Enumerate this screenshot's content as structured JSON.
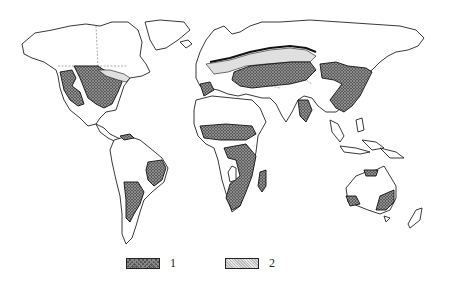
{
  "map": {
    "type": "world distribution map",
    "style": "black-and-white, hatched regions",
    "zones": [
      {
        "id": "1",
        "pattern": "dark cross-hatch",
        "regions": [
          "central/western North America",
          "Iberia",
          "Sahel belt of Africa",
          "southern/eastern Africa",
          "Madagascar",
          "eastern Brazil",
          "Argentina",
          "southern Russia/Kazakhstan steppe",
          "Mongolia/north-east China",
          "eastern China",
          "India",
          "northern Australia",
          "south-western Australia",
          "south-eastern Australia"
        ]
      },
      {
        "id": "2",
        "pattern": "light stipple",
        "regions": [
          "Great Lakes / south-eastern Canada",
          "eastern Europe / southern Russia forest-steppe belt"
        ]
      }
    ]
  },
  "legend": {
    "items": [
      {
        "label": "1",
        "pattern": "dark"
      },
      {
        "label": "2",
        "pattern": "light"
      }
    ]
  }
}
